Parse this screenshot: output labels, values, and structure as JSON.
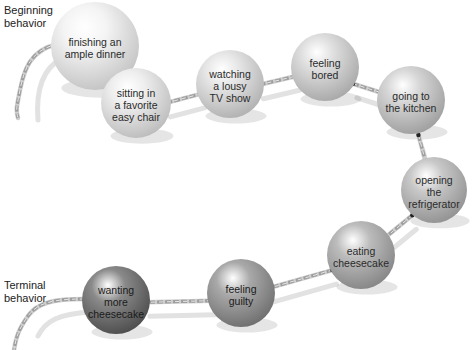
{
  "labels": {
    "beginning": "Beginning\nbehavior",
    "terminal": "Terminal\nbehavior"
  },
  "balls": [
    {
      "id": "finishing-dinner",
      "text": "finishing an\nample dinner",
      "cx": 95,
      "cy": 46,
      "r": 44,
      "shade": "#f4f4f4",
      "edge": "#c4c4c4"
    },
    {
      "id": "sitting-chair",
      "text": "sitting in\na favorite\neasy chair",
      "cx": 136,
      "cy": 103,
      "r": 35,
      "shade": "#eeeeee",
      "edge": "#bdbdbd"
    },
    {
      "id": "watching-tv",
      "text": "watching\na lousy\nTV show",
      "cx": 230,
      "cy": 84,
      "r": 34,
      "shade": "#e6e6e6",
      "edge": "#b2b2b2"
    },
    {
      "id": "feeling-bored",
      "text": "feeling\nbored",
      "cx": 325,
      "cy": 67,
      "r": 34,
      "shade": "#dedede",
      "edge": "#a9a9a9"
    },
    {
      "id": "going-kitchen",
      "text": "going to\nthe kitchen",
      "cx": 411,
      "cy": 100,
      "r": 34,
      "shade": "#d6d6d6",
      "edge": "#a0a0a0"
    },
    {
      "id": "opening-fridge",
      "text": "opening the\nrefrigerator",
      "cx": 434,
      "cy": 190,
      "r": 33,
      "shade": "#c8c8c8",
      "edge": "#939393"
    },
    {
      "id": "eating-cheesecake",
      "text": "eating\ncheesecake",
      "cx": 361,
      "cy": 255,
      "r": 34,
      "shade": "#bcbcbc",
      "edge": "#878787"
    },
    {
      "id": "feeling-guilty",
      "text": "feeling\nguilty",
      "cx": 241,
      "cy": 293,
      "r": 34,
      "shade": "#a9a9a9",
      "edge": "#707070"
    },
    {
      "id": "wanting-more",
      "text": "wanting\nmore\ncheesecake",
      "cx": 116,
      "cy": 300,
      "r": 34,
      "shade": "#8a8a8a",
      "edge": "#4e4e4e"
    }
  ],
  "chain": {
    "color": "#9e9e9e",
    "shadow": "#e2e2e2"
  }
}
